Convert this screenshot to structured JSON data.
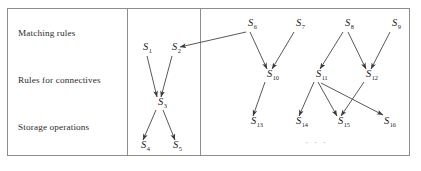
{
  "figure": {
    "background_color": "#ffffff",
    "frame_color": "#8d8d8d",
    "edge_color": "#3a3a3a",
    "text_color": "#1c1c1c",
    "label_color": "#2b2b2b",
    "ellipsis_color": "#b9b9b9"
  },
  "frame": {
    "x": 7.5,
    "y": 8.5,
    "width": 402,
    "height": 147,
    "dividers": [
      127.5,
      200.5
    ]
  },
  "row_labels": [
    {
      "id": "matching-rules",
      "text": "Matching rules",
      "x": 18,
      "y": 36
    },
    {
      "id": "rules-for-connectives",
      "text": "Rules for connectives",
      "x": 18,
      "y": 83
    },
    {
      "id": "storage-operations",
      "text": "Storage operations",
      "x": 18,
      "y": 130
    }
  ],
  "nodes": [
    {
      "id": "S1",
      "base": "S",
      "sub": "1",
      "x": 143,
      "y": 50
    },
    {
      "id": "S2",
      "base": "S",
      "sub": "2",
      "x": 172,
      "y": 50
    },
    {
      "id": "S3",
      "base": "S",
      "sub": "3",
      "x": 158,
      "y": 105
    },
    {
      "id": "S4",
      "base": "S",
      "sub": "4",
      "x": 141,
      "y": 148
    },
    {
      "id": "S5",
      "base": "S",
      "sub": "5",
      "x": 173,
      "y": 148
    },
    {
      "id": "S6",
      "base": "S",
      "sub": "6",
      "x": 248,
      "y": 26
    },
    {
      "id": "S7",
      "base": "S",
      "sub": "7",
      "x": 296,
      "y": 26
    },
    {
      "id": "S8",
      "base": "S",
      "sub": "8",
      "x": 345,
      "y": 26
    },
    {
      "id": "S9",
      "base": "S",
      "sub": "9",
      "x": 392,
      "y": 26
    },
    {
      "id": "S10",
      "base": "S",
      "sub": "10",
      "x": 267,
      "y": 77
    },
    {
      "id": "S11",
      "base": "S",
      "sub": "11",
      "x": 316,
      "y": 77
    },
    {
      "id": "S12",
      "base": "S",
      "sub": "12",
      "x": 366,
      "y": 77
    },
    {
      "id": "S13",
      "base": "S",
      "sub": "13",
      "x": 251,
      "y": 124
    },
    {
      "id": "S14",
      "base": "S",
      "sub": "14",
      "x": 296,
      "y": 124
    },
    {
      "id": "S15",
      "base": "S",
      "sub": "15",
      "x": 338,
      "y": 124
    },
    {
      "id": "S16",
      "base": "S",
      "sub": "16",
      "x": 384,
      "y": 124
    }
  ],
  "edges": [
    {
      "id": "e-S1-S3",
      "from": "S1",
      "to": "S3",
      "x1": 147,
      "y1": 56,
      "x2": 157,
      "y2": 97
    },
    {
      "id": "e-S2-S3",
      "from": "S2",
      "to": "S3",
      "x1": 172,
      "y1": 56,
      "x2": 161,
      "y2": 97
    },
    {
      "id": "e-S3-S4",
      "from": "S3",
      "to": "S4",
      "x1": 156,
      "y1": 110,
      "x2": 143,
      "y2": 140
    },
    {
      "id": "e-S3-S5",
      "from": "S3",
      "to": "S5",
      "x1": 163,
      "y1": 110,
      "x2": 175,
      "y2": 140
    },
    {
      "id": "e-S6-S2",
      "from": "S6",
      "to": "S2",
      "x1": 246,
      "y1": 32,
      "x2": 180,
      "y2": 47
    },
    {
      "id": "e-S6-S10",
      "from": "S6",
      "to": "S10",
      "x1": 250,
      "y1": 32,
      "x2": 267,
      "y2": 69
    },
    {
      "id": "e-S7-S10",
      "from": "S7",
      "to": "S10",
      "x1": 294,
      "y1": 32,
      "x2": 272,
      "y2": 69
    },
    {
      "id": "e-S8-S11",
      "from": "S8",
      "to": "S11",
      "x1": 343,
      "y1": 32,
      "x2": 320,
      "y2": 69
    },
    {
      "id": "e-S8-S12",
      "from": "S8",
      "to": "S12",
      "x1": 348,
      "y1": 32,
      "x2": 366,
      "y2": 69
    },
    {
      "id": "e-S9-S12",
      "from": "S9",
      "to": "S12",
      "x1": 390,
      "y1": 32,
      "x2": 371,
      "y2": 69
    },
    {
      "id": "e-S10-S13",
      "from": "S10",
      "to": "S13",
      "x1": 265,
      "y1": 82,
      "x2": 253,
      "y2": 116
    },
    {
      "id": "e-S11-S14",
      "from": "S11",
      "to": "S14",
      "x1": 314,
      "y1": 82,
      "x2": 299,
      "y2": 116
    },
    {
      "id": "e-S11-S15",
      "from": "S11",
      "to": "S15",
      "x1": 318,
      "y1": 82,
      "x2": 337,
      "y2": 116
    },
    {
      "id": "e-S11-S16",
      "from": "S11",
      "to": "S16",
      "x1": 321,
      "y1": 83,
      "x2": 383,
      "y2": 115
    },
    {
      "id": "e-S12-S15",
      "from": "S12",
      "to": "S15",
      "x1": 364,
      "y1": 82,
      "x2": 341,
      "y2": 116
    }
  ],
  "ellipsis": {
    "id": "continuation-ellipsis",
    "text": "· · ·",
    "x": 305,
    "y": 146
  }
}
